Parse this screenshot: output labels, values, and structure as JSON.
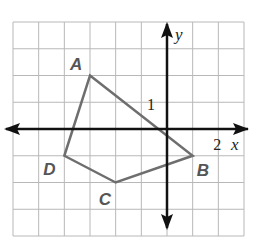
{
  "figure": {
    "grid": {
      "cols": 9,
      "rows": 8,
      "x_min": -6,
      "x_max": 3,
      "y_min": -4,
      "y_max": 4,
      "left_px": 13,
      "top_px": 22,
      "right_px": 244,
      "bottom_px": 236,
      "line_color": "#b8b8b8"
    },
    "axes": {
      "x_label": "x",
      "y_label": "y",
      "x_tick_label": "2",
      "x_tick_value": 2,
      "y_tick_label": "1",
      "y_tick_value": 1,
      "color": "#111111"
    },
    "polygon": {
      "stroke_color": "#6e6e6e",
      "vertices": [
        {
          "label": "A",
          "x": -3,
          "y": 2
        },
        {
          "label": "B",
          "x": 1,
          "y": -1
        },
        {
          "label": "C",
          "x": -2,
          "y": -2
        },
        {
          "label": "D",
          "x": -4,
          "y": -1
        }
      ]
    },
    "vertex_label_color": "#555555"
  }
}
